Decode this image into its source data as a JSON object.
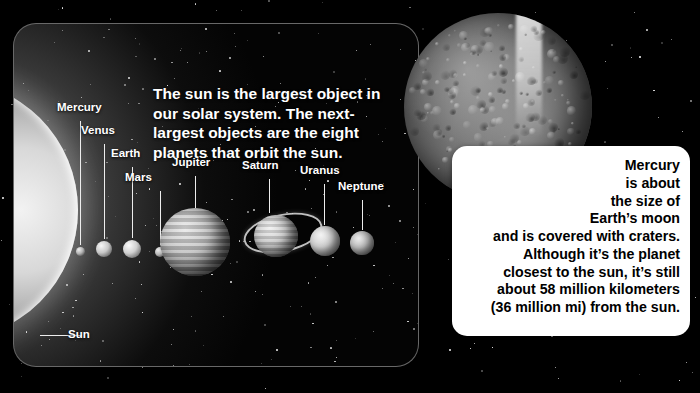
{
  "page": {
    "background_color": "#000000"
  },
  "left_panel": {
    "name": "solar-system-diagram",
    "headline": "The sun is the largest object in our solar system. The next-largest objects are the eight planets that orbit the sun.",
    "sun_label": "Sun",
    "planets": [
      {
        "label": "Mercury"
      },
      {
        "label": "Venus"
      },
      {
        "label": "Earth"
      },
      {
        "label": "Mars"
      },
      {
        "label": "Jupiter"
      },
      {
        "label": "Saturn"
      },
      {
        "label": "Uranus"
      },
      {
        "label": "Neptune"
      }
    ]
  },
  "mercury_photo": {
    "name": "mercury-photograph",
    "alt": "Photograph of the planet Mercury showing a heavily cratered gray surface"
  },
  "callout": {
    "name": "mercury-fact-box",
    "lines": [
      "Mercury",
      "is about",
      "the size of",
      "Earth’s moon",
      "and is covered with craters.",
      "Although it’s the planet",
      "closest to the sun, it’s still",
      "about 58 million kilometers",
      "(36 million mi) from the sun."
    ],
    "text": "Mercury is about the size of Earth’s moon and is covered with craters. Although it’s the planet closest to the sun, it’s still about 58 million kilometers (36 million mi) from the sun."
  }
}
